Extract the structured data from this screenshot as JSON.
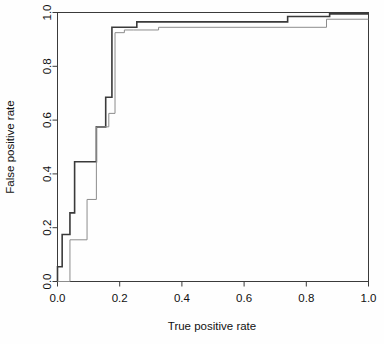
{
  "chart_data": {
    "type": "line",
    "title": "",
    "xlabel": "True positive rate",
    "ylabel": "False positive rate",
    "xlim": [
      0.0,
      1.0
    ],
    "ylim": [
      0.0,
      1.0
    ],
    "grid": false,
    "legend": "none",
    "xticks": [
      0.0,
      0.2,
      0.4,
      0.6,
      0.8,
      1.0
    ],
    "yticks": [
      0.0,
      0.2,
      0.4,
      0.6,
      0.8,
      1.0
    ],
    "xticklabels": [
      "0.0",
      "0.2",
      "0.4",
      "0.6",
      "0.8",
      "1.0"
    ],
    "yticklabels": [
      "0.0",
      "0.2",
      "0.4",
      "0.6",
      "0.8",
      "1.0"
    ],
    "drawstyle": "steps-post",
    "series": [
      {
        "name": "curve-bold",
        "color": "#3a3a3a",
        "linewidth": 1.6,
        "x": [
          0.0,
          0.0,
          0.015,
          0.015,
          0.04,
          0.04,
          0.055,
          0.055,
          0.095,
          0.095,
          0.125,
          0.125,
          0.155,
          0.155,
          0.175,
          0.175,
          0.205,
          0.205,
          0.255,
          0.255,
          0.74,
          0.74,
          0.875,
          0.875,
          1.0
        ],
        "y": [
          0.0,
          0.055,
          0.055,
          0.175,
          0.175,
          0.255,
          0.255,
          0.445,
          0.445,
          0.445,
          0.445,
          0.575,
          0.575,
          0.685,
          0.685,
          0.945,
          0.945,
          0.945,
          0.945,
          0.965,
          0.965,
          0.985,
          0.985,
          0.995,
          0.995
        ]
      },
      {
        "name": "curve-thin",
        "color": "#8c8c8c",
        "linewidth": 1.0,
        "x": [
          0.0,
          0.04,
          0.04,
          0.095,
          0.095,
          0.125,
          0.125,
          0.165,
          0.165,
          0.185,
          0.185,
          0.215,
          0.215,
          0.245,
          0.245,
          0.325,
          0.325,
          0.865,
          0.865,
          1.0
        ],
        "y": [
          0.0,
          0.0,
          0.155,
          0.155,
          0.305,
          0.305,
          0.575,
          0.575,
          0.625,
          0.625,
          0.925,
          0.925,
          0.935,
          0.935,
          0.935,
          0.935,
          0.945,
          0.945,
          0.975,
          0.975
        ]
      }
    ]
  },
  "axes": {
    "x_title": "True positive rate",
    "y_title": "False positive rate"
  }
}
